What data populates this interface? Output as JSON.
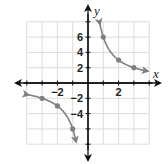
{
  "chart_data": {
    "type": "line",
    "title": "",
    "function": "y = 6/x",
    "xlabel": "x",
    "ylabel": "y",
    "xlim": [
      -4,
      4
    ],
    "ylim": [
      -8,
      8
    ],
    "grid": true,
    "x_ticks": [
      {
        "value": -2,
        "label": "−2"
      },
      {
        "value": 2,
        "label": "2"
      }
    ],
    "y_ticks": [
      {
        "value": 6,
        "label": "6"
      },
      {
        "value": 4,
        "label": "4"
      },
      {
        "value": 2,
        "label": "2"
      },
      {
        "value": -2,
        "label": "−2"
      },
      {
        "value": -4,
        "label": "−4"
      }
    ],
    "series": [
      {
        "name": "right-branch",
        "points": [
          {
            "x": 1,
            "y": 6
          },
          {
            "x": 2,
            "y": 3
          },
          {
            "x": 3,
            "y": 2
          }
        ]
      },
      {
        "name": "left-branch",
        "points": [
          {
            "x": -1,
            "y": -6
          },
          {
            "x": -2,
            "y": -3
          },
          {
            "x": -3,
            "y": -2
          }
        ]
      }
    ]
  },
  "colors": {
    "axis": "#111111",
    "grid": "#dcdcdc",
    "curve": "#808080"
  }
}
